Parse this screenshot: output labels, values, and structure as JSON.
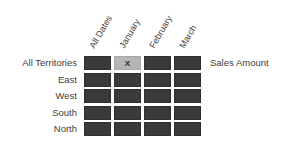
{
  "diagram": {
    "column_headers": [
      "All Dates",
      "January",
      "February",
      "March"
    ],
    "row_labels": [
      "All Territories",
      "East",
      "West",
      "South",
      "North"
    ],
    "measure_label": "Sales Amount",
    "selected_cell": {
      "row": 0,
      "col": 1,
      "marker": "X"
    },
    "colors": {
      "cell_fill": "#3a3a3a",
      "selected_fill": "#b5b5b5",
      "text": "#404040",
      "background": "#ffffff"
    }
  }
}
